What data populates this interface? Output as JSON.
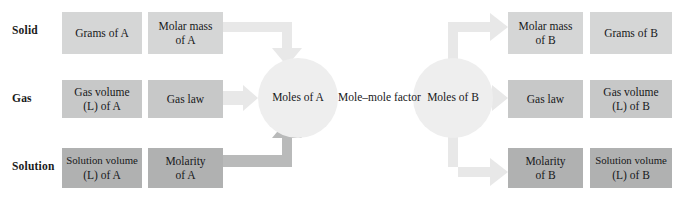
{
  "diagram": {
    "colors": {
      "box_light": "#d5d6d6",
      "box_mid": "#c7c8c8",
      "box_dark": "#b0b1b1",
      "circle": "#eeeeee",
      "arrow_light": "#e8e8e8",
      "arrow_dark": "#b9baba",
      "text": "#17181a",
      "background": "#ffffff"
    },
    "row_labels": [
      {
        "label": "Solid"
      },
      {
        "label": "Gas"
      },
      {
        "label": "Solution"
      }
    ],
    "center": {
      "left_circle_label": "Moles of A",
      "right_circle_label": "Moles of B",
      "connector_label": "Mole–mole factor"
    },
    "left_boxes": [
      {
        "name": "grams-of-a",
        "line1": "Grams of A",
        "line2": "",
        "row": "Solid"
      },
      {
        "name": "molar-mass-of-a",
        "line1": "Molar mass",
        "line2": "of A",
        "row": "Solid"
      },
      {
        "name": "gas-volume-l-of-a",
        "line1": "Gas volume",
        "line2": "(L) of A",
        "row": "Gas"
      },
      {
        "name": "gas-law-a",
        "line1": "Gas law",
        "line2": "",
        "row": "Gas"
      },
      {
        "name": "solution-volume-l-of-a",
        "line1": "Solution volume",
        "line2": "(L) of A",
        "row": "Solution"
      },
      {
        "name": "molarity-of-a",
        "line1": "Molarity",
        "line2": "of A",
        "row": "Solution"
      }
    ],
    "right_boxes": [
      {
        "name": "molar-mass-of-b",
        "line1": "Molar mass",
        "line2": "of B",
        "row": "Solid"
      },
      {
        "name": "grams-of-b",
        "line1": "Grams of B",
        "line2": "",
        "row": "Solid"
      },
      {
        "name": "gas-law-b",
        "line1": "Gas law",
        "line2": "",
        "row": "Gas"
      },
      {
        "name": "gas-volume-l-of-b",
        "line1": "Gas volume",
        "line2": "(L) of B",
        "row": "Gas"
      },
      {
        "name": "molarity-of-b",
        "line1": "Molarity",
        "line2": "of B",
        "row": "Solution"
      },
      {
        "name": "solution-volume-l-of-b",
        "line1": "Solution volume",
        "line2": "(L) of B",
        "row": "Solution"
      }
    ],
    "arrows": [
      {
        "name": "arrow-solid-a-to-moles",
        "from": "molar-mass-of-a",
        "to": "moles-of-a",
        "shape": "elbow-right-down",
        "tone": "light"
      },
      {
        "name": "arrow-gas-a-to-moles",
        "from": "gas-law-a",
        "to": "moles-of-a",
        "shape": "straight-right",
        "tone": "light"
      },
      {
        "name": "arrow-solution-a-to-moles",
        "from": "molarity-of-a",
        "to": "moles-of-a",
        "shape": "elbow-right-up",
        "tone": "dark"
      },
      {
        "name": "arrow-moles-to-solid-b",
        "from": "moles-of-b",
        "to": "molar-mass-of-b",
        "shape": "elbow-up-right",
        "tone": "light"
      },
      {
        "name": "arrow-moles-to-gas-b",
        "from": "moles-of-b",
        "to": "gas-law-b",
        "shape": "straight-right",
        "tone": "light"
      },
      {
        "name": "arrow-moles-to-solution-b",
        "from": "moles-of-b",
        "to": "molarity-of-b",
        "shape": "elbow-down-right",
        "tone": "light"
      }
    ]
  }
}
